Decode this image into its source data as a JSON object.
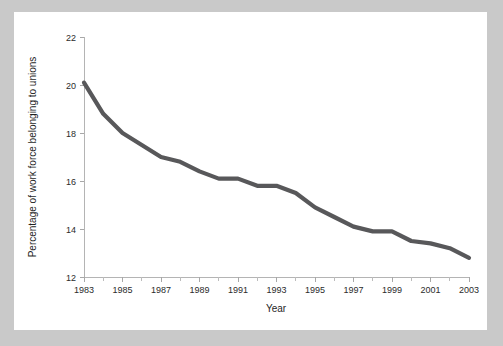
{
  "figure": {
    "background_color": "#c9c9c9",
    "card_color": "#ffffff",
    "line_color": "#58585a",
    "axis_color": "#b4b4b4"
  },
  "chart_data": {
    "type": "line",
    "title": "",
    "xlabel": "Year",
    "ylabel": "Percentage of work force belonging to unions",
    "xlim": [
      1983,
      2003
    ],
    "ylim": [
      12,
      22
    ],
    "grid": false,
    "legend": null,
    "x_tick_labels": [
      "1983",
      "1985",
      "1987",
      "1989",
      "1991",
      "1993",
      "1995",
      "1997",
      "1999",
      "2001",
      "2003"
    ],
    "x_tick_values": [
      1983,
      1985,
      1987,
      1989,
      1991,
      1993,
      1995,
      1997,
      1999,
      2001,
      2003
    ],
    "x_minor_tick_values": [
      1984,
      1986,
      1988,
      1990,
      1992,
      1994,
      1996,
      1998,
      2000,
      2002
    ],
    "y_tick_labels": [
      "12",
      "14",
      "16",
      "18",
      "20",
      "22"
    ],
    "y_tick_values": [
      12,
      14,
      16,
      18,
      20,
      22
    ],
    "x": [
      1983,
      1984,
      1985,
      1986,
      1987,
      1988,
      1989,
      1990,
      1991,
      1992,
      1993,
      1994,
      1995,
      1996,
      1997,
      1998,
      1999,
      2000,
      2001,
      2002,
      2003
    ],
    "values": [
      20.1,
      18.8,
      18.0,
      17.5,
      17.0,
      16.8,
      16.4,
      16.1,
      16.1,
      15.8,
      15.8,
      15.5,
      14.9,
      14.5,
      14.1,
      13.9,
      13.9,
      13.5,
      13.4,
      13.2,
      12.8
    ],
    "series": [
      {
        "name": "Percentage of work force belonging to unions",
        "values": [
          20.1,
          18.8,
          18.0,
          17.5,
          17.0,
          16.8,
          16.4,
          16.1,
          16.1,
          15.8,
          15.8,
          15.5,
          14.9,
          14.5,
          14.1,
          13.9,
          13.9,
          13.5,
          13.4,
          13.2,
          12.8
        ]
      }
    ]
  }
}
